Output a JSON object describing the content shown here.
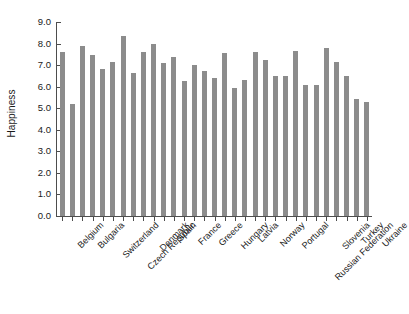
{
  "chart_data": {
    "type": "bar",
    "title": "",
    "xlabel": "",
    "ylabel": "Happiness",
    "ylim": [
      0.0,
      9.0
    ],
    "ytick_labels": [
      "9.0",
      "8.0",
      "7.0",
      "6.0",
      "5.0",
      "4.0",
      "3.0",
      "2.0",
      "1.0",
      "0.0"
    ],
    "ytick_values": [
      9.0,
      8.0,
      7.0,
      6.0,
      5.0,
      4.0,
      3.0,
      2.0,
      1.0,
      0.0
    ],
    "grid": false,
    "legend": "none",
    "bar_color": "#8c8c8c",
    "axis_color": "#4d4d4d",
    "categories": [
      "Belgium",
      "",
      "Bulgaria",
      "",
      "Switzerland",
      "",
      "Czech Republic",
      "",
      "Denmark",
      "",
      "Spain",
      "",
      "France",
      "",
      "Greece",
      "",
      "Hungary",
      "",
      "Latvia",
      "",
      "Norway",
      "",
      "Portugal",
      "",
      "Russian Federation",
      "",
      "Slovenia",
      "",
      "Turkey",
      "",
      "Ukraine"
    ],
    "tick_labels": [
      "Belgium",
      "Bulgaria",
      "Switzerland",
      "Czech Republic",
      "Denmark",
      "Spain",
      "France",
      "Greece",
      "Hungary",
      "Latvia",
      "Norway",
      "Portugal",
      "Russian Federation",
      "Slovenia",
      "Turkey",
      "Ukraine"
    ],
    "values": [
      7.6,
      5.2,
      7.9,
      7.45,
      6.8,
      7.15,
      8.35,
      6.65,
      7.6,
      8.0,
      7.1,
      7.4,
      6.25,
      7.0,
      6.75,
      6.4,
      7.55,
      5.95,
      6.3,
      7.6,
      7.25,
      6.5,
      6.5,
      7.65,
      6.1,
      6.1,
      7.8,
      7.15,
      6.5,
      5.45,
      5.3
    ]
  }
}
